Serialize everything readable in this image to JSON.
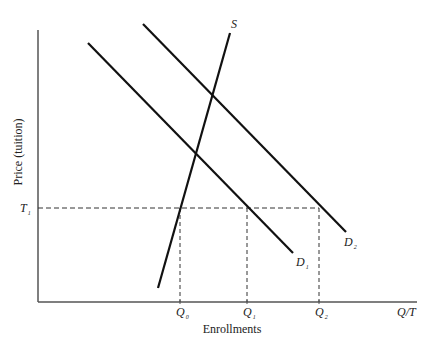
{
  "chart_data": {
    "type": "line",
    "title": "",
    "xlabel": "Enrollments",
    "ylabel": "Price (tuition)",
    "x_axis_end_label": "Q/T",
    "grid": false,
    "legend": null,
    "series": [
      {
        "name": "S",
        "kind": "supply",
        "points": [
          [
            158,
            288
          ],
          [
            230,
            33
          ]
        ],
        "label": "S",
        "label_pos": [
          231,
          28
        ]
      },
      {
        "name": "D1",
        "kind": "demand",
        "points": [
          [
            88,
            43
          ],
          [
            293,
            253
          ]
        ],
        "label": "D",
        "sub": "1",
        "label_pos": [
          296,
          266
        ]
      },
      {
        "name": "D2",
        "kind": "demand",
        "points": [
          [
            143,
            24
          ],
          [
            346,
            232
          ]
        ],
        "label": "D",
        "sub": "2",
        "label_pos": [
          344,
          246
        ]
      }
    ],
    "reference_lines": {
      "price": {
        "label": "T",
        "sub": "1",
        "y": 208
      },
      "quantities": [
        {
          "label": "Q",
          "sub": "0",
          "x": 180
        },
        {
          "label": "Q",
          "sub": "1",
          "x": 247
        },
        {
          "label": "Q",
          "sub": "2",
          "x": 319
        }
      ]
    },
    "axes": {
      "origin": [
        38,
        302
      ],
      "y_top": 30,
      "x_right": 417
    },
    "colors": {
      "line": "#111111",
      "axis": "#555555",
      "dash": "#333333"
    }
  }
}
